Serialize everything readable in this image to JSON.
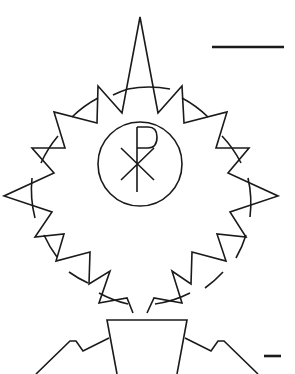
{
  "figure": {
    "background": "#ffffff",
    "stroke_color": "#1a1a1a",
    "elements": [
      {
        "name": "sunburst-emblem",
        "description": "circle ringed by triangular spikes, opening at bottom"
      },
      {
        "name": "chi-rho-medallion",
        "description": "Chi-Rho monogram inside a circle"
      },
      {
        "name": "scale-bar-top",
        "description": "horizontal scale line, upper right"
      },
      {
        "name": "trapezoid-base",
        "description": "inverted trapezoid with shouldered arms, partially cropped at bottom"
      },
      {
        "name": "scale-bar-bottom",
        "description": "short horizontal scale line, lower right"
      }
    ]
  }
}
